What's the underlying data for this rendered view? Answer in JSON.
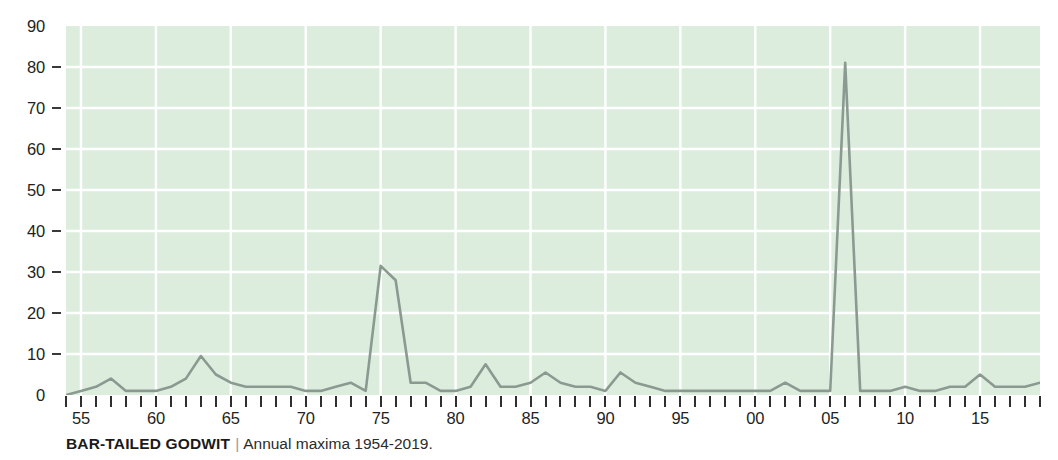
{
  "caption": {
    "title": "BAR-TAILED GODWIT",
    "separator": "|",
    "subtitle": "Annual maxima 1954-2019."
  },
  "colors": {
    "plot_background": "#dcedde",
    "gridline": "#ffffff",
    "series_line": "#8b9a91",
    "tick": "#2f2f2f",
    "text": "#231f20",
    "caption_separator": "#9a9a9a"
  },
  "chart_data": {
    "type": "line",
    "title": "BAR-TAILED GODWIT",
    "subtitle": "Annual maxima 1954-2019.",
    "xlabel": "",
    "ylabel": "",
    "xlim": [
      1954,
      2019
    ],
    "ylim": [
      0,
      90
    ],
    "yticks": [
      0,
      10,
      20,
      30,
      40,
      50,
      60,
      70,
      80,
      90
    ],
    "ytick_labels": [
      "0",
      "10",
      "20",
      "30",
      "40",
      "50",
      "60",
      "70",
      "80",
      "90"
    ],
    "xticks": [
      1955,
      1960,
      1965,
      1970,
      1975,
      1980,
      1985,
      1990,
      1995,
      2000,
      2005,
      2010,
      2015
    ],
    "xtick_labels": [
      "55",
      "60",
      "65",
      "70",
      "75",
      "80",
      "85",
      "90",
      "95",
      "00",
      "05",
      "10",
      "15"
    ],
    "xtick_minor_every": 1,
    "grid": true,
    "grid_color": "#ffffff",
    "legend": false,
    "series": [
      {
        "name": "Annual maxima",
        "color": "#8b9a91",
        "x": [
          1954,
          1955,
          1956,
          1957,
          1958,
          1959,
          1960,
          1961,
          1962,
          1963,
          1964,
          1965,
          1966,
          1967,
          1968,
          1969,
          1970,
          1971,
          1972,
          1973,
          1974,
          1975,
          1976,
          1977,
          1978,
          1979,
          1980,
          1981,
          1982,
          1983,
          1984,
          1985,
          1986,
          1987,
          1988,
          1989,
          1990,
          1991,
          1992,
          1993,
          1994,
          1995,
          1996,
          1997,
          1998,
          1999,
          2000,
          2001,
          2002,
          2003,
          2004,
          2005,
          2006,
          2007,
          2008,
          2009,
          2010,
          2011,
          2012,
          2013,
          2014,
          2015,
          2016,
          2017,
          2018,
          2019
        ],
        "values": [
          0,
          1,
          2,
          4,
          1,
          1,
          1,
          2,
          4,
          9.5,
          5,
          3,
          2,
          2,
          2,
          2,
          1,
          1,
          2,
          3,
          1,
          31.5,
          28,
          3,
          3,
          1,
          1,
          2,
          7.5,
          2,
          2,
          3,
          5.5,
          3,
          2,
          2,
          1,
          5.5,
          3,
          2,
          1,
          1,
          1,
          1,
          1,
          1,
          1,
          1,
          3,
          1,
          1,
          1,
          81,
          1,
          1,
          1,
          2,
          1,
          1,
          2,
          2,
          5,
          2,
          2,
          2,
          3
        ]
      }
    ]
  },
  "y_axis": {
    "ticks": [
      {
        "label": "90",
        "value": 90,
        "dash": false
      },
      {
        "label": "80",
        "value": 80,
        "dash": true
      },
      {
        "label": "70",
        "value": 70,
        "dash": true
      },
      {
        "label": "60",
        "value": 60,
        "dash": true
      },
      {
        "label": "50",
        "value": 50,
        "dash": true
      },
      {
        "label": "40",
        "value": 40,
        "dash": true
      },
      {
        "label": "30",
        "value": 30,
        "dash": true
      },
      {
        "label": "20",
        "value": 20,
        "dash": true
      },
      {
        "label": "10",
        "value": 10,
        "dash": true
      },
      {
        "label": "0",
        "value": 0,
        "dash": false
      }
    ]
  },
  "x_axis": {
    "labels": [
      {
        "label": "55",
        "value": 1955
      },
      {
        "label": "60",
        "value": 1960
      },
      {
        "label": "65",
        "value": 1965
      },
      {
        "label": "70",
        "value": 1970
      },
      {
        "label": "75",
        "value": 1975
      },
      {
        "label": "80",
        "value": 1980
      },
      {
        "label": "85",
        "value": 1985
      },
      {
        "label": "90",
        "value": 1990
      },
      {
        "label": "95",
        "value": 1995
      },
      {
        "label": "00",
        "value": 2000
      },
      {
        "label": "05",
        "value": 2005
      },
      {
        "label": "10",
        "value": 2010
      },
      {
        "label": "15",
        "value": 2015
      }
    ]
  }
}
